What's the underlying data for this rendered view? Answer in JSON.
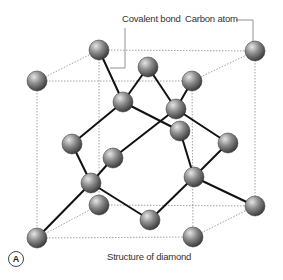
{
  "labels": {
    "covalent_bond": "Covalent bond",
    "carbon_atom": "Carbon atom",
    "caption": "Structure of diamond",
    "panel": "A"
  },
  "colors": {
    "bond": "#111111",
    "cube_edge": "#8a8a8a",
    "atom_light": "#d8d8d8",
    "atom_mid": "#8c8c8c",
    "atom_dark": "#3c3c3c",
    "leader": "#666666"
  },
  "atoms": [
    {
      "id": "c1",
      "x": 99,
      "y": 50
    },
    {
      "id": "c2",
      "x": 255,
      "y": 51
    },
    {
      "id": "c3",
      "x": 37,
      "y": 81
    },
    {
      "id": "c4",
      "x": 192,
      "y": 81
    },
    {
      "id": "c5",
      "x": 148,
      "y": 67
    },
    {
      "id": "c6",
      "x": 123,
      "y": 102
    },
    {
      "id": "c7",
      "x": 176,
      "y": 109
    },
    {
      "id": "c8",
      "x": 180,
      "y": 131
    },
    {
      "id": "c9",
      "x": 228,
      "y": 143
    },
    {
      "id": "c10",
      "x": 72,
      "y": 144
    },
    {
      "id": "c11",
      "x": 113,
      "y": 158
    },
    {
      "id": "c12",
      "x": 91,
      "y": 183
    },
    {
      "id": "c13",
      "x": 194,
      "y": 177
    },
    {
      "id": "c14",
      "x": 99,
      "y": 205
    },
    {
      "id": "c15",
      "x": 255,
      "y": 206
    },
    {
      "id": "c16",
      "x": 150,
      "y": 220
    },
    {
      "id": "c17",
      "x": 37,
      "y": 238
    },
    {
      "id": "c18",
      "x": 193,
      "y": 237
    }
  ],
  "bonds": [
    [
      "c1",
      "c6"
    ],
    [
      "c5",
      "c6"
    ],
    [
      "c5",
      "c7"
    ],
    [
      "c4",
      "c7"
    ],
    [
      "c6",
      "c10"
    ],
    [
      "c6",
      "c8"
    ],
    [
      "c7",
      "c11"
    ],
    [
      "c7",
      "c9"
    ],
    [
      "c10",
      "c12"
    ],
    [
      "c11",
      "c12"
    ],
    [
      "c12",
      "c17"
    ],
    [
      "c12",
      "c16"
    ],
    [
      "c8",
      "c13"
    ],
    [
      "c9",
      "c13"
    ],
    [
      "c13",
      "c16"
    ],
    [
      "c13",
      "c15"
    ]
  ],
  "cube_edges": [
    [
      "c1",
      "c2"
    ],
    [
      "c3",
      "c4"
    ],
    [
      "c3",
      "c1"
    ],
    [
      "c4",
      "c2"
    ],
    [
      "c3",
      "c17"
    ],
    [
      "c1",
      "c14"
    ],
    [
      "c4",
      "c18"
    ],
    [
      "c2",
      "c15"
    ],
    [
      "c17",
      "c18"
    ],
    [
      "c14",
      "c15"
    ],
    [
      "c17",
      "c14"
    ],
    [
      "c18",
      "c15"
    ]
  ]
}
